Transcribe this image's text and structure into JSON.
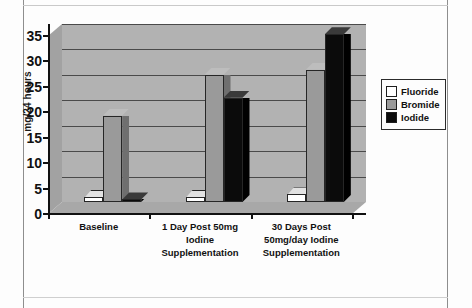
{
  "chart_data": {
    "type": "bar",
    "title": "",
    "xlabel": "",
    "ylabel": "mg/24 hours",
    "ylim": [
      0,
      35
    ],
    "yticks": [
      0,
      5,
      10,
      15,
      20,
      25,
      30,
      35
    ],
    "ytick_labels": [
      "0",
      "5",
      "10",
      "15",
      "20",
      "25",
      "30",
      "35"
    ],
    "grid": true,
    "legend_position": "right",
    "style": "3d-clustered-column",
    "categories": [
      "Baseline",
      "1 Day Post 50mg Iodine Supplementation",
      "30 Days Post 50mg/day Iodine Supplementation"
    ],
    "category_lines": [
      [
        "Baseline"
      ],
      [
        "1 Day Post 50mg",
        "Iodine",
        "Supplementation"
      ],
      [
        "30 Days Post",
        "50mg/day Iodine",
        "Supplementation"
      ]
    ],
    "series": [
      {
        "name": "Fluoride",
        "color": "#ffffff",
        "values": [
          1.0,
          1.0,
          1.5
        ]
      },
      {
        "name": "Bromide",
        "color": "#9a9a9a",
        "values": [
          17.0,
          25.0,
          26.0
        ]
      },
      {
        "name": "Iodide",
        "color": "#0b0b0b",
        "values": [
          0.5,
          20.5,
          33.0
        ]
      }
    ]
  },
  "legend": {
    "items": [
      {
        "label": "Fluoride"
      },
      {
        "label": "Bromide"
      },
      {
        "label": "Iodide"
      }
    ]
  },
  "colors": {
    "plot_background": "#b2b2b2",
    "gridline": "#4a4a4a",
    "axis": "#111111",
    "page_background": "#fdfdfd"
  }
}
